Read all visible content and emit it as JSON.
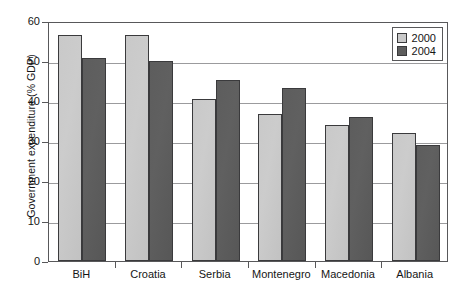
{
  "chart_data": {
    "type": "bar",
    "title": "",
    "xlabel": "",
    "ylabel": "Government expenditure (% GDP)",
    "ylim": [
      0,
      60
    ],
    "yticks": [
      0,
      10,
      20,
      30,
      40,
      50,
      60
    ],
    "ytick_labels": [
      "0",
      "10",
      "20",
      "30",
      "40",
      "50",
      "60"
    ],
    "grid": "horizontal",
    "legend_position": "top-right",
    "categories": [
      "BiH",
      "Croatia",
      "Serbia",
      "Montenegro",
      "Macedonia",
      "Albania"
    ],
    "series": [
      {
        "name": "2000",
        "color": "#c9c9c9",
        "values": [
          56.6,
          56.6,
          40.5,
          36.7,
          34.0,
          32.0
        ]
      },
      {
        "name": "2004",
        "color": "#5d5d5d",
        "values": [
          50.8,
          50.1,
          45.2,
          43.3,
          36.0,
          29.0
        ]
      }
    ]
  },
  "legend": {
    "items": [
      {
        "label": "2000"
      },
      {
        "label": "2004"
      }
    ]
  }
}
